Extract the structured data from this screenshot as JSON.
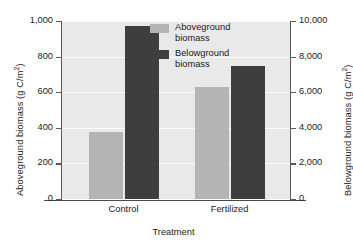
{
  "chart_data": {
    "type": "bar",
    "title": "",
    "categories": [
      "Control",
      "Fertilized"
    ],
    "xlabel": "Treatment",
    "series": [
      {
        "name": "Aboveground biomass",
        "axis": "left",
        "color": "#b4b4b4",
        "values": [
          378,
          630
        ],
        "unit": "g C/m2"
      },
      {
        "name": "Belowground biomass",
        "axis": "right",
        "color": "#3e3e3e",
        "values": [
          9700,
          7450
        ],
        "values_left_scale": [
          970,
          745
        ],
        "unit": "g C/m2"
      }
    ],
    "left_axis": {
      "label_prefix": "Aboveground biomass (g C/m",
      "label_suffix": ")",
      "label_sup": "2",
      "ylim": [
        0,
        1000
      ],
      "ticks": [
        "0",
        "200",
        "400",
        "600",
        "800",
        "1,000"
      ],
      "tick_values": [
        0,
        200,
        400,
        600,
        800,
        1000
      ]
    },
    "right_axis": {
      "label_prefix": "Belowground biomass (g C/m",
      "label_suffix": ")",
      "label_sup": "2",
      "ylim": [
        0,
        10000
      ],
      "ticks": [
        "0",
        "2,000",
        "4,000",
        "6,000",
        "8,000",
        "10,000"
      ],
      "tick_values": [
        0,
        2000,
        4000,
        6000,
        8000,
        10000
      ]
    },
    "grid": true,
    "legend_position": "top-right-inside",
    "plot_background": "#e9e9e9"
  },
  "legend": {
    "items": [
      {
        "label_line1": "Aboveground",
        "label_line2": "biomass"
      },
      {
        "label_line1": "Belowground",
        "label_line2": "biomass"
      }
    ]
  }
}
